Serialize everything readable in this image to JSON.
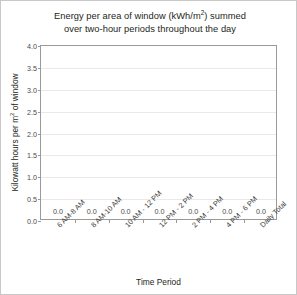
{
  "chart_data": {
    "type": "bar",
    "title": "Energy per area of window (kWh/m2) summed over two-hour periods throughout the day",
    "title_line1_pre": "Energy per area of window (kWh/m",
    "title_line1_sup": "2",
    "title_line1_post": ") summed",
    "title_line2": "over two-hour periods throughout the day",
    "xlabel": "Time Period",
    "ylabel_pre": "Kilowatt hours per m",
    "ylabel_sup": "2",
    "ylabel_post": " of window",
    "ylabel": "Kilowatt hours per m2 of window",
    "categories": [
      "6 AM-8 AM",
      "8 AM-10 AM",
      "10 AM - 12 PM",
      "12 PM - 2 PM",
      "2 PM - 4 PM",
      "4 PM - 6 PM",
      "Daily Total"
    ],
    "values": [
      0.0,
      0.0,
      0.0,
      0.0,
      0.0,
      0.0,
      0.0
    ],
    "data_labels": [
      "0.0",
      "0.0",
      "0.0",
      "0.0",
      "0.0",
      "0.0",
      "0.0"
    ],
    "ylim": [
      0.0,
      4.0
    ],
    "ytick_values": [
      0.0,
      0.5,
      1.0,
      1.5,
      2.0,
      2.5,
      3.0,
      3.5,
      4.0
    ],
    "ytick_labels": [
      "0.0",
      "0.5",
      "1.0",
      "1.5",
      "2.0",
      "2.5",
      "3.0",
      "3.5",
      "4.0"
    ],
    "grid": true,
    "grid_axis": "y",
    "legend": false,
    "bar_color": "#4472a8",
    "grid_color": "#e9e9e9",
    "axis_color": "#9a9a9a",
    "text_color": "#231f20",
    "frame_border_color": "#c8c8c8",
    "background": "#ffffff"
  }
}
